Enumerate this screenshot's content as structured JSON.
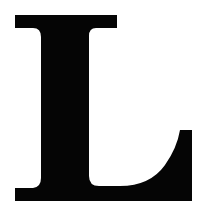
{
  "image": {
    "letter": "L",
    "description": "Serif capital letter",
    "colors": {
      "glyph": "#050505",
      "background": "#ffffff"
    }
  }
}
